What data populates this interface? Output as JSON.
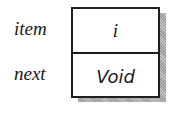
{
  "diagram": {
    "fields": [
      {
        "label": "item",
        "value": "i"
      },
      {
        "label": "next",
        "value": "Void"
      }
    ],
    "colors": {
      "border": "#1e1e1e",
      "shadow": "#a8a8a8",
      "background": "#ffffff"
    }
  }
}
